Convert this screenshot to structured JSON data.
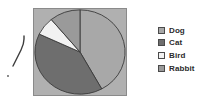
{
  "chart_data": {
    "type": "pie",
    "title": "",
    "categories": [
      "Dog",
      "Cat",
      "Bird",
      "Rabbit"
    ],
    "values": [
      42,
      40,
      7,
      11
    ],
    "colors": [
      "#a8a8a8",
      "#6e6e6e",
      "#f2f2f2",
      "#9a9a9a"
    ],
    "start_angle_deg": 0,
    "direction": "clockwise",
    "legend_position": "right",
    "grid": false,
    "plot_background": "#b0b0b0",
    "slice_border_color": "#3a3a3a"
  },
  "legend": {
    "items": [
      {
        "label": "Dog",
        "color": "#a8a8a8"
      },
      {
        "label": "Cat",
        "color": "#6e6e6e"
      },
      {
        "label": "Bird",
        "color": "#f2f2f2"
      },
      {
        "label": "Rabbit",
        "color": "#9a9a9a"
      }
    ]
  },
  "annotation": {
    "stroke_color": "#3d3d3d",
    "description": "handwritten-pen-mark"
  }
}
